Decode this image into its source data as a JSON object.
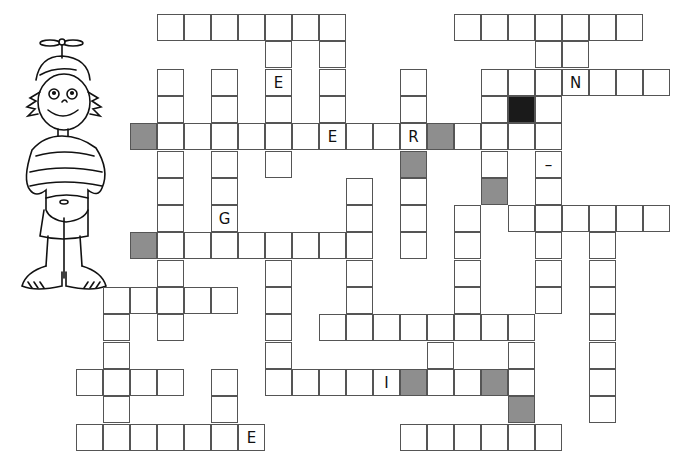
{
  "puzzle": {
    "type": "crossword",
    "cell_size_px": 27,
    "origin": {
      "x": 77,
      "y": 15
    },
    "row_step_px": 27.3,
    "illustration": "boy-with-propeller-cap",
    "cells": [
      {
        "r": 0,
        "c": 3
      },
      {
        "r": 0,
        "c": 4
      },
      {
        "r": 0,
        "c": 5
      },
      {
        "r": 0,
        "c": 6
      },
      {
        "r": 0,
        "c": 7
      },
      {
        "r": 0,
        "c": 8
      },
      {
        "r": 0,
        "c": 9
      },
      {
        "r": 0,
        "c": 14
      },
      {
        "r": 0,
        "c": 15
      },
      {
        "r": 0,
        "c": 16
      },
      {
        "r": 0,
        "c": 17
      },
      {
        "r": 0,
        "c": 18
      },
      {
        "r": 0,
        "c": 19
      },
      {
        "r": 0,
        "c": 20
      },
      {
        "r": 1,
        "c": 7
      },
      {
        "r": 1,
        "c": 9
      },
      {
        "r": 1,
        "c": 17
      },
      {
        "r": 1,
        "c": 18
      },
      {
        "r": 2,
        "c": 3
      },
      {
        "r": 2,
        "c": 5
      },
      {
        "r": 2,
        "c": 7,
        "letter": "E"
      },
      {
        "r": 2,
        "c": 9
      },
      {
        "r": 2,
        "c": 12
      },
      {
        "r": 2,
        "c": 15
      },
      {
        "r": 2,
        "c": 16
      },
      {
        "r": 2,
        "c": 17
      },
      {
        "r": 2,
        "c": 18,
        "letter": "N"
      },
      {
        "r": 2,
        "c": 19
      },
      {
        "r": 2,
        "c": 20
      },
      {
        "r": 2,
        "c": 21
      },
      {
        "r": 3,
        "c": 3
      },
      {
        "r": 3,
        "c": 5
      },
      {
        "r": 3,
        "c": 7
      },
      {
        "r": 3,
        "c": 9
      },
      {
        "r": 3,
        "c": 12
      },
      {
        "r": 3,
        "c": 15
      },
      {
        "r": 3,
        "c": 16,
        "fill": "black"
      },
      {
        "r": 3,
        "c": 17
      },
      {
        "r": 4,
        "c": 2,
        "fill": "gray"
      },
      {
        "r": 4,
        "c": 3
      },
      {
        "r": 4,
        "c": 4
      },
      {
        "r": 4,
        "c": 5
      },
      {
        "r": 4,
        "c": 6
      },
      {
        "r": 4,
        "c": 7
      },
      {
        "r": 4,
        "c": 8
      },
      {
        "r": 4,
        "c": 9,
        "letter": "E"
      },
      {
        "r": 4,
        "c": 10
      },
      {
        "r": 4,
        "c": 11
      },
      {
        "r": 4,
        "c": 12,
        "letter": "R"
      },
      {
        "r": 4,
        "c": 13,
        "fill": "gray"
      },
      {
        "r": 4,
        "c": 14
      },
      {
        "r": 4,
        "c": 15
      },
      {
        "r": 4,
        "c": 16
      },
      {
        "r": 4,
        "c": 17
      },
      {
        "r": 5,
        "c": 3
      },
      {
        "r": 5,
        "c": 5
      },
      {
        "r": 5,
        "c": 7
      },
      {
        "r": 5,
        "c": 12,
        "fill": "gray"
      },
      {
        "r": 5,
        "c": 15
      },
      {
        "r": 5,
        "c": 17,
        "letter": "–"
      },
      {
        "r": 6,
        "c": 3
      },
      {
        "r": 6,
        "c": 5
      },
      {
        "r": 6,
        "c": 10
      },
      {
        "r": 6,
        "c": 12
      },
      {
        "r": 6,
        "c": 15,
        "fill": "gray"
      },
      {
        "r": 6,
        "c": 17
      },
      {
        "r": 7,
        "c": 3
      },
      {
        "r": 7,
        "c": 5,
        "letter": "G"
      },
      {
        "r": 7,
        "c": 10
      },
      {
        "r": 7,
        "c": 12
      },
      {
        "r": 7,
        "c": 14
      },
      {
        "r": 7,
        "c": 16
      },
      {
        "r": 7,
        "c": 17
      },
      {
        "r": 7,
        "c": 18
      },
      {
        "r": 7,
        "c": 19
      },
      {
        "r": 7,
        "c": 20
      },
      {
        "r": 7,
        "c": 21
      },
      {
        "r": 8,
        "c": 2,
        "fill": "gray"
      },
      {
        "r": 8,
        "c": 3
      },
      {
        "r": 8,
        "c": 4
      },
      {
        "r": 8,
        "c": 5
      },
      {
        "r": 8,
        "c": 6
      },
      {
        "r": 8,
        "c": 7
      },
      {
        "r": 8,
        "c": 8
      },
      {
        "r": 8,
        "c": 9
      },
      {
        "r": 8,
        "c": 10
      },
      {
        "r": 8,
        "c": 12
      },
      {
        "r": 8,
        "c": 14
      },
      {
        "r": 8,
        "c": 17
      },
      {
        "r": 8,
        "c": 19
      },
      {
        "r": 9,
        "c": 3
      },
      {
        "r": 9,
        "c": 7
      },
      {
        "r": 9,
        "c": 10
      },
      {
        "r": 9,
        "c": 14
      },
      {
        "r": 9,
        "c": 17
      },
      {
        "r": 9,
        "c": 19
      },
      {
        "r": 10,
        "c": 1
      },
      {
        "r": 10,
        "c": 2
      },
      {
        "r": 10,
        "c": 3
      },
      {
        "r": 10,
        "c": 4
      },
      {
        "r": 10,
        "c": 5
      },
      {
        "r": 10,
        "c": 7
      },
      {
        "r": 10,
        "c": 10
      },
      {
        "r": 10,
        "c": 14
      },
      {
        "r": 10,
        "c": 17
      },
      {
        "r": 10,
        "c": 19
      },
      {
        "r": 11,
        "c": 1
      },
      {
        "r": 11,
        "c": 3
      },
      {
        "r": 11,
        "c": 7
      },
      {
        "r": 11,
        "c": 9
      },
      {
        "r": 11,
        "c": 10
      },
      {
        "r": 11,
        "c": 11
      },
      {
        "r": 11,
        "c": 12
      },
      {
        "r": 11,
        "c": 13
      },
      {
        "r": 11,
        "c": 14
      },
      {
        "r": 11,
        "c": 15
      },
      {
        "r": 11,
        "c": 16
      },
      {
        "r": 11,
        "c": 19
      },
      {
        "r": 12,
        "c": 1
      },
      {
        "r": 12,
        "c": 7
      },
      {
        "r": 12,
        "c": 13
      },
      {
        "r": 12,
        "c": 16
      },
      {
        "r": 12,
        "c": 19
      },
      {
        "r": 13,
        "c": 0
      },
      {
        "r": 13,
        "c": 1
      },
      {
        "r": 13,
        "c": 2
      },
      {
        "r": 13,
        "c": 3
      },
      {
        "r": 13,
        "c": 5
      },
      {
        "r": 13,
        "c": 7
      },
      {
        "r": 13,
        "c": 8
      },
      {
        "r": 13,
        "c": 9
      },
      {
        "r": 13,
        "c": 10
      },
      {
        "r": 13,
        "c": 11,
        "letter": "I"
      },
      {
        "r": 13,
        "c": 12,
        "fill": "gray"
      },
      {
        "r": 13,
        "c": 13
      },
      {
        "r": 13,
        "c": 14
      },
      {
        "r": 13,
        "c": 15,
        "fill": "gray"
      },
      {
        "r": 13,
        "c": 16
      },
      {
        "r": 13,
        "c": 19
      },
      {
        "r": 14,
        "c": 1
      },
      {
        "r": 14,
        "c": 5
      },
      {
        "r": 14,
        "c": 16,
        "fill": "gray"
      },
      {
        "r": 14,
        "c": 19
      },
      {
        "r": 15,
        "c": 0
      },
      {
        "r": 15,
        "c": 1
      },
      {
        "r": 15,
        "c": 2
      },
      {
        "r": 15,
        "c": 3
      },
      {
        "r": 15,
        "c": 4
      },
      {
        "r": 15,
        "c": 5
      },
      {
        "r": 15,
        "c": 6,
        "letter": "E"
      },
      {
        "r": 15,
        "c": 12
      },
      {
        "r": 15,
        "c": 13
      },
      {
        "r": 15,
        "c": 14
      },
      {
        "r": 15,
        "c": 15
      },
      {
        "r": 15,
        "c": 16
      },
      {
        "r": 15,
        "c": 17
      }
    ]
  }
}
